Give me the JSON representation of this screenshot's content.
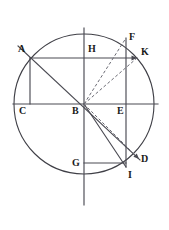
{
  "figure": {
    "canvas": {
      "width": 169,
      "height": 230
    },
    "colors": {
      "stroke": "#3f3f46",
      "stroke_dark": "#2b2b2b",
      "label": "#1a1a1a",
      "background": "#ffffff"
    }
  },
  "chart_data": {
    "type": "diagram",
    "circle": {
      "center_label": "B",
      "cx": 84,
      "cy": 104,
      "r": 70
    },
    "points": [
      {
        "label": "A",
        "x": 30,
        "y": 58,
        "label_x": 18,
        "label_y": 44
      },
      {
        "label": "B",
        "x": 84,
        "y": 104,
        "label_x": 72,
        "label_y": 106
      },
      {
        "label": "C",
        "x": 30,
        "y": 104,
        "label_x": 19,
        "label_y": 106
      },
      {
        "label": "D",
        "x": 137,
        "y": 157,
        "label_x": 141,
        "label_y": 154
      },
      {
        "label": "E",
        "x": 126,
        "y": 104,
        "label_x": 117,
        "label_y": 106
      },
      {
        "label": "F",
        "x": 126,
        "y": 38,
        "label_x": 129,
        "label_y": 32
      },
      {
        "label": "G",
        "x": 84,
        "y": 163,
        "label_x": 72,
        "label_y": 158
      },
      {
        "label": "H",
        "x": 84,
        "y": 58,
        "label_x": 88,
        "label_y": 44
      },
      {
        "label": "I",
        "x": 126,
        "y": 167,
        "label_x": 128,
        "label_y": 170
      },
      {
        "label": "K",
        "x": 137,
        "y": 58,
        "label_x": 141,
        "label_y": 47
      }
    ],
    "solid_lines": [
      {
        "name": "vertical-axis",
        "from": [
          84,
          28
        ],
        "to": [
          84,
          205
        ]
      },
      {
        "name": "horizontal-axis",
        "from": [
          13,
          104
        ],
        "to": [
          158,
          104
        ]
      },
      {
        "name": "chord-A-K",
        "from": [
          30,
          58
        ],
        "to": [
          137,
          58
        ]
      },
      {
        "name": "segment-C-A",
        "from": [
          30,
          104
        ],
        "to": [
          30,
          58
        ]
      },
      {
        "name": "diagonal-A-D",
        "from": [
          18,
          46
        ],
        "to": [
          140,
          160
        ]
      },
      {
        "name": "vertical-F-I",
        "from": [
          126,
          38
        ],
        "to": [
          126,
          167
        ]
      },
      {
        "name": "radius-B-I",
        "from": [
          84,
          104
        ],
        "to": [
          126,
          167
        ]
      },
      {
        "name": "segment-G-I",
        "from": [
          84,
          163
        ],
        "to": [
          126,
          163
        ]
      }
    ],
    "dashed_lines": [
      {
        "name": "dashed-B-F",
        "from": [
          84,
          104
        ],
        "to": [
          126,
          38
        ]
      },
      {
        "name": "dashed-B-K",
        "from": [
          84,
          104
        ],
        "to": [
          137,
          58
        ]
      },
      {
        "name": "dashed-B-D",
        "from": [
          84,
          104
        ],
        "to": [
          137,
          157
        ]
      }
    ],
    "arrowheads": [
      {
        "name": "arrow-at-K",
        "x": 137,
        "y": 58,
        "angle_deg": 0
      },
      {
        "name": "arrow-at-D",
        "x": 139,
        "y": 159,
        "angle_deg": 45
      }
    ],
    "labels": [
      "A",
      "B",
      "C",
      "D",
      "E",
      "F",
      "G",
      "H",
      "I",
      "K"
    ]
  }
}
